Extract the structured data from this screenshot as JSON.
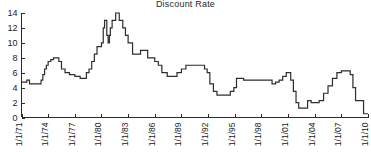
{
  "chart_data": {
    "type": "line",
    "title": "Discount Rate",
    "xlabel": "",
    "ylabel": "",
    "ylim": [
      0,
      14
    ],
    "yticks": [
      0,
      2,
      4,
      6,
      8,
      10,
      12,
      14
    ],
    "ytick_labels": [
      "0",
      "2",
      "4",
      "6",
      "8",
      "10",
      "12",
      "14"
    ],
    "xlim": [
      "1/1/71",
      "1/1/10"
    ],
    "xtick_labels": [
      "1/1/71",
      "1/1/74",
      "1/1/77",
      "1/1/80",
      "1/1/83",
      "1/1/86",
      "1/1/89",
      "1/1/92",
      "1/1/95",
      "1/1/98",
      "1/1/01",
      "1/1/04",
      "1/1/07",
      "1/1/10"
    ],
    "xtick_rotation": 90,
    "grid": false,
    "legend": null,
    "line_color": "#2d2d2d",
    "series": [
      {
        "name": "Discount Rate",
        "step": true,
        "x": [
          1971.0,
          1971.3,
          1971.6,
          1971.9,
          1972.2,
          1972.6,
          1973.0,
          1973.2,
          1973.4,
          1973.6,
          1973.8,
          1974.0,
          1974.3,
          1974.6,
          1974.9,
          1975.2,
          1975.5,
          1975.9,
          1976.4,
          1977.0,
          1977.6,
          1978.0,
          1978.3,
          1978.6,
          1978.9,
          1979.2,
          1979.5,
          1979.8,
          1980.0,
          1980.2,
          1980.35,
          1980.5,
          1980.6,
          1980.75,
          1980.9,
          1981.0,
          1981.2,
          1981.4,
          1981.6,
          1981.8,
          1982.0,
          1982.4,
          1982.7,
          1983.0,
          1983.5,
          1984.0,
          1984.4,
          1984.8,
          1985.2,
          1985.6,
          1986.0,
          1986.4,
          1986.8,
          1987.4,
          1988.0,
          1988.5,
          1989.0,
          1989.5,
          1990.0,
          1990.8,
          1991.2,
          1991.6,
          1991.9,
          1992.2,
          1992.6,
          1993.0,
          1994.0,
          1994.5,
          1994.9,
          1995.2,
          1995.6,
          1996.0,
          1996.5,
          1997.0,
          1998.0,
          1998.8,
          1999.2,
          1999.6,
          2000.0,
          2000.4,
          2000.8,
          2001.0,
          2001.3,
          2001.6,
          2001.9,
          2002.2,
          2002.9,
          2003.2,
          2003.6,
          2004.0,
          2004.5,
          2005.0,
          2005.5,
          2006.0,
          2006.5,
          2007.0,
          2007.6,
          2008.0,
          2008.3,
          2008.6,
          2009.0,
          2009.5,
          2010.0
        ],
        "y": [
          4.75,
          4.75,
          5.0,
          4.5,
          4.5,
          4.5,
          4.5,
          5.0,
          5.75,
          6.5,
          7.0,
          7.5,
          7.75,
          8.0,
          8.0,
          7.5,
          6.5,
          6.0,
          5.75,
          5.5,
          5.25,
          5.25,
          6.0,
          6.5,
          7.5,
          8.5,
          9.5,
          9.5,
          10.0,
          12.0,
          13.0,
          13.0,
          11.0,
          10.0,
          11.0,
          12.0,
          13.0,
          13.0,
          14.0,
          14.0,
          13.0,
          12.0,
          11.0,
          10.0,
          8.5,
          8.5,
          9.0,
          9.0,
          8.0,
          8.0,
          7.5,
          7.0,
          6.0,
          5.5,
          5.5,
          6.0,
          6.5,
          7.0,
          7.0,
          7.0,
          7.0,
          6.5,
          6.0,
          4.5,
          3.5,
          3.0,
          3.0,
          3.5,
          4.0,
          5.25,
          5.25,
          5.0,
          5.0,
          5.0,
          5.0,
          5.0,
          4.5,
          4.75,
          5.0,
          5.5,
          6.0,
          6.0,
          5.0,
          3.5,
          2.0,
          1.25,
          1.25,
          2.25,
          2.0,
          2.0,
          2.25,
          3.25,
          4.25,
          5.25,
          6.0,
          6.25,
          6.25,
          5.75,
          4.0,
          2.25,
          2.25,
          0.5,
          0.5
        ]
      }
    ]
  },
  "axes": {
    "y_axis_name": "y-axis",
    "x_axis_name": "x-axis"
  }
}
